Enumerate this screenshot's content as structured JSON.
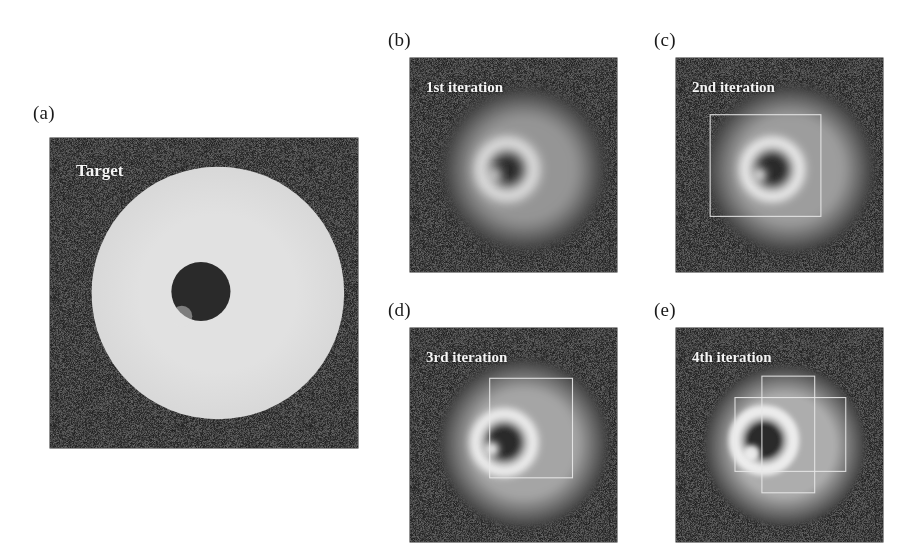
{
  "figure": {
    "background_color": "#ffffff",
    "panel_background_color": "#232323",
    "specimen_color": "#c8c8c8",
    "hole_color": "#2c2c2c",
    "support_outline_color": "#e8e8e8",
    "caption_color": "#f4f4f4",
    "label_color": "#1a1a1a"
  },
  "panels": [
    {
      "id": "a",
      "label": "(a)",
      "caption": "Target",
      "caption_size": 17,
      "has_support": false,
      "support_shape": "none",
      "description": "Ground-truth object: uniform bright disc with a left rectangular tab, one dark circular hole and one faint bright speck.",
      "frame": {
        "x": 50,
        "y": 138,
        "w": 308,
        "h": 310
      },
      "label_pos": {
        "x": 33,
        "y": 103
      },
      "caption_pos": {
        "x": 26,
        "y": 24
      },
      "object": {
        "cx": 0.545,
        "cy": 0.5,
        "r": 0.205,
        "blur": 0.6,
        "brightness": 1.0
      },
      "hole": {
        "cx": 0.49,
        "cy": 0.495,
        "r": 0.048
      },
      "speck": {
        "cx": 0.428,
        "cy": 0.575,
        "r": 0.017,
        "visible": false
      }
    },
    {
      "id": "b",
      "label": "(b)",
      "caption": "1st iteration",
      "caption_size": 15,
      "has_support": false,
      "support_shape": "none",
      "description": "Reconstruction after one iteration: blurred disc, bright ring around the hole, no support overlay drawn.",
      "frame": {
        "x": 410,
        "y": 58,
        "w": 207,
        "h": 214
      },
      "label_pos": {
        "x": 388,
        "y": 30
      },
      "caption_pos": {
        "x": 16,
        "y": 22
      },
      "object": {
        "cx": 0.55,
        "cy": 0.52,
        "r": 0.2,
        "blur": 5.5,
        "brightness": 0.62
      },
      "hole": {
        "cx": 0.47,
        "cy": 0.52,
        "r": 0.042
      },
      "speck": {
        "cx": 0.41,
        "cy": 0.545,
        "r": 0.016,
        "visible": true
      }
    },
    {
      "id": "c",
      "label": "(c)",
      "caption": "2nd iteration",
      "caption_size": 15,
      "has_support": true,
      "support_shape": "rect",
      "description": "Reconstruction after two iterations with a square support constraint outlined in white.",
      "frame": {
        "x": 676,
        "y": 58,
        "w": 207,
        "h": 214
      },
      "label_pos": {
        "x": 654,
        "y": 30
      },
      "caption_pos": {
        "x": 16,
        "y": 22
      },
      "object": {
        "cx": 0.55,
        "cy": 0.52,
        "r": 0.205,
        "blur": 4.5,
        "brightness": 0.66
      },
      "hole": {
        "cx": 0.465,
        "cy": 0.52,
        "r": 0.043
      },
      "speck": {
        "cx": 0.405,
        "cy": 0.545,
        "r": 0.016,
        "visible": true
      },
      "support_rect": {
        "x": 0.165,
        "y": 0.265,
        "w": 0.535,
        "h": 0.475
      }
    },
    {
      "id": "d",
      "label": "(d)",
      "caption": "3rd iteration",
      "caption_size": 15,
      "has_support": true,
      "support_shape": "rect",
      "description": "Reconstruction after three iterations; the support rectangle is now taller than wide.",
      "frame": {
        "x": 410,
        "y": 328,
        "w": 207,
        "h": 214
      },
      "label_pos": {
        "x": 388,
        "y": 300
      },
      "caption_pos": {
        "x": 16,
        "y": 22
      },
      "object": {
        "cx": 0.55,
        "cy": 0.54,
        "r": 0.205,
        "blur": 3.6,
        "brightness": 0.7
      },
      "hole": {
        "cx": 0.455,
        "cy": 0.535,
        "r": 0.045
      },
      "speck": {
        "cx": 0.395,
        "cy": 0.565,
        "r": 0.018,
        "visible": true
      },
      "support_rect": {
        "x": 0.385,
        "y": 0.235,
        "w": 0.4,
        "h": 0.465
      }
    },
    {
      "id": "e",
      "label": "(e)",
      "caption": "4th iteration",
      "caption_size": 15,
      "has_support": true,
      "support_shape": "cross",
      "description": "Reconstruction after four iterations; the support is a cross formed by the union of a tall and a wide rectangle.",
      "frame": {
        "x": 676,
        "y": 328,
        "w": 207,
        "h": 214
      },
      "label_pos": {
        "x": 654,
        "y": 300
      },
      "caption_pos": {
        "x": 16,
        "y": 22
      },
      "object": {
        "cx": 0.525,
        "cy": 0.55,
        "r": 0.195,
        "blur": 2.6,
        "brightness": 0.74
      },
      "hole": {
        "cx": 0.425,
        "cy": 0.525,
        "r": 0.046
      },
      "speck": {
        "cx": 0.365,
        "cy": 0.585,
        "r": 0.02,
        "visible": true
      },
      "support_cross": {
        "vertical": {
          "x": 0.415,
          "y": 0.225,
          "w": 0.255,
          "h": 0.545
        },
        "horizontal": {
          "x": 0.285,
          "y": 0.325,
          "w": 0.535,
          "h": 0.345
        }
      }
    }
  ]
}
